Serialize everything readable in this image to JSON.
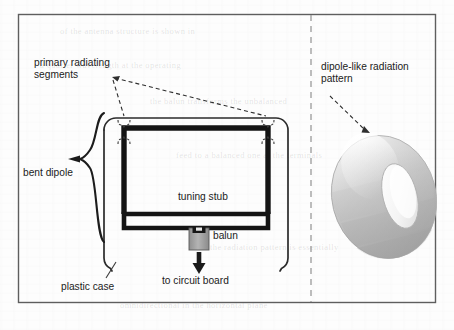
{
  "figure": {
    "panels": {
      "left": {
        "name": "bent dipole antenna cross-section"
      },
      "right": {
        "name": "radiation pattern"
      }
    },
    "labels": {
      "primary_radiating_segments": "primary radiating\nsegments",
      "bent_dipole": "bent dipole",
      "tuning_stub": "tuning stub",
      "balun": "balun",
      "to_circuit_board": "to circuit board",
      "plastic_case": "plastic case",
      "dipole_like_radiation_pattern": "dipole-like radiation\npattern"
    },
    "colors": {
      "page": "#fdfdfd",
      "ink": "#1a1a1a",
      "frame": "#5e5e5e",
      "divider": "#9a9a9a",
      "conductor": "#141414",
      "case": "#2b2b2b",
      "balun_body": "#9d9d9d",
      "torus_light": "#f2f2f2",
      "torus_mid": "#d2d2d2",
      "torus_dark": "#a8a8a8"
    },
    "ghost_text": [
      "of the antenna structure is shown in",
      "a quarter wavelength at the operating",
      "the balun transforms the unbalanced",
      "feed to a balanced one at the terminals",
      "the radiation pattern is essentially",
      "omnidirectional in the horizontal plane"
    ]
  }
}
